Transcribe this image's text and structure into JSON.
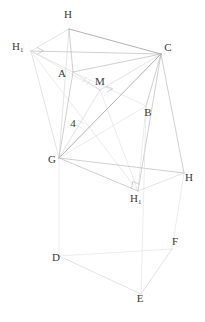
{
  "figure": {
    "canvas": {
      "width": 205,
      "height": 322
    },
    "colors": {
      "background": "#ffffff",
      "edge_dark": "#7d7d7d",
      "edge_mid": "#a8a8a8",
      "edge_light": "#c9c9c9",
      "edge_faint": "#d8d8d8",
      "label_text": "#3a3a3a"
    },
    "labels": [
      {
        "id": "label-H-top",
        "base": "H",
        "sub": "",
        "x": 68,
        "y": 18,
        "anchor": "middle"
      },
      {
        "id": "label-H1-left",
        "base": "H",
        "sub": "1",
        "x": 12,
        "y": 50,
        "anchor": "start"
      },
      {
        "id": "label-C",
        "base": "C",
        "sub": "",
        "x": 168,
        "y": 51,
        "anchor": "middle"
      },
      {
        "id": "label-A",
        "base": "A",
        "sub": "",
        "x": 62,
        "y": 77,
        "anchor": "middle"
      },
      {
        "id": "label-M",
        "base": "M",
        "sub": "",
        "x": 100,
        "y": 85,
        "anchor": "middle"
      },
      {
        "id": "label-B",
        "base": "B",
        "sub": "",
        "x": 148,
        "y": 116,
        "anchor": "middle"
      },
      {
        "id": "label-4",
        "base": "4",
        "sub": "",
        "x": 73,
        "y": 127,
        "anchor": "middle"
      },
      {
        "id": "label-G",
        "base": "G",
        "sub": "",
        "x": 52,
        "y": 163,
        "anchor": "middle"
      },
      {
        "id": "label-H-right",
        "base": "H",
        "sub": "",
        "x": 189,
        "y": 181,
        "anchor": "middle"
      },
      {
        "id": "label-H1-bottom",
        "base": "H",
        "sub": "1",
        "x": 130,
        "y": 202,
        "anchor": "start"
      },
      {
        "id": "label-F",
        "base": "F",
        "sub": "",
        "x": 175,
        "y": 245,
        "anchor": "middle"
      },
      {
        "id": "label-D",
        "base": "D",
        "sub": "",
        "x": 56,
        "y": 261,
        "anchor": "middle"
      },
      {
        "id": "label-E",
        "base": "E",
        "sub": "",
        "x": 140,
        "y": 302,
        "anchor": "middle"
      }
    ],
    "points": {
      "H_top": {
        "x": 69,
        "y": 29
      },
      "H1_left": {
        "x": 31,
        "y": 51
      },
      "C": {
        "x": 161,
        "y": 54
      },
      "A": {
        "x": 73,
        "y": 72
      },
      "M": {
        "x": 100,
        "y": 90
      },
      "B": {
        "x": 146,
        "y": 106
      },
      "G": {
        "x": 59,
        "y": 158
      },
      "H_right": {
        "x": 184,
        "y": 173
      },
      "H1_bottom": {
        "x": 138,
        "y": 191
      },
      "F": {
        "x": 172,
        "y": 249
      },
      "D": {
        "x": 59,
        "y": 256
      },
      "E": {
        "x": 141,
        "y": 294
      }
    },
    "edges": [
      {
        "name": "edge-H-top-to-H1-left",
        "from": "H_top",
        "to": "H1_left",
        "weight": "light"
      },
      {
        "name": "edge-H-top-to-C",
        "from": "H_top",
        "to": "C",
        "weight": "dark"
      },
      {
        "name": "edge-H-top-to-A",
        "from": "H_top",
        "to": "A",
        "weight": "mid"
      },
      {
        "name": "edge-H-top-to-G",
        "from": "H_top",
        "to": "G",
        "weight": "light"
      },
      {
        "name": "edge-H1-left-to-A",
        "from": "H1_left",
        "to": "A",
        "weight": "light"
      },
      {
        "name": "edge-H1-left-to-C",
        "from": "H1_left",
        "to": "C",
        "weight": "mid"
      },
      {
        "name": "edge-H1-left-to-G",
        "from": "H1_left",
        "to": "G",
        "weight": "light"
      },
      {
        "name": "edge-H1-left-to-M",
        "from": "H1_left",
        "to": "M",
        "weight": "faint"
      },
      {
        "name": "edge-H1-left-to-H1-bottom",
        "from": "H1_left",
        "to": "H1_bottom",
        "weight": "faint"
      },
      {
        "name": "edge-A-to-C",
        "from": "A",
        "to": "C",
        "weight": "mid"
      },
      {
        "name": "edge-A-to-G",
        "from": "A",
        "to": "G",
        "weight": "mid"
      },
      {
        "name": "edge-A-to-M",
        "from": "A",
        "to": "M",
        "weight": "light"
      },
      {
        "name": "edge-A-to-B",
        "from": "A",
        "to": "B",
        "weight": "faint"
      },
      {
        "name": "edge-C-to-B",
        "from": "C",
        "to": "B",
        "weight": "mid"
      },
      {
        "name": "edge-C-to-G",
        "from": "C",
        "to": "G",
        "weight": "dark"
      },
      {
        "name": "edge-C-to-M",
        "from": "C",
        "to": "M",
        "weight": "light"
      },
      {
        "name": "edge-C-to-H-right",
        "from": "C",
        "to": "H_right",
        "weight": "mid"
      },
      {
        "name": "edge-C-to-H1-bottom",
        "from": "C",
        "to": "H1_bottom",
        "weight": "mid"
      },
      {
        "name": "edge-B-to-G",
        "from": "B",
        "to": "G",
        "weight": "faint"
      },
      {
        "name": "edge-B-to-H1-bottom",
        "from": "B",
        "to": "H1_bottom",
        "weight": "faint"
      },
      {
        "name": "edge-M-to-G",
        "from": "M",
        "to": "G",
        "weight": "light"
      },
      {
        "name": "edge-M-to-H1-bottom",
        "from": "M",
        "to": "H1_bottom",
        "weight": "faint"
      },
      {
        "name": "edge-G-to-H-right",
        "from": "G",
        "to": "H_right",
        "weight": "mid"
      },
      {
        "name": "edge-G-to-H1-bottom",
        "from": "G",
        "to": "H1_bottom",
        "weight": "mid"
      },
      {
        "name": "edge-H-right-to-H1-bottom",
        "from": "H_right",
        "to": "H1_bottom",
        "weight": "light"
      },
      {
        "name": "edge-G-to-D",
        "from": "G",
        "to": "D",
        "weight": "faint"
      },
      {
        "name": "edge-H-right-to-F",
        "from": "H_right",
        "to": "F",
        "weight": "faint"
      },
      {
        "name": "edge-D-to-E",
        "from": "D",
        "to": "E",
        "weight": "light"
      },
      {
        "name": "edge-D-to-F",
        "from": "D",
        "to": "F",
        "weight": "faint"
      },
      {
        "name": "edge-E-to-F",
        "from": "E",
        "to": "F",
        "weight": "light"
      },
      {
        "name": "edge-B-to-E",
        "from": "B",
        "to": "E",
        "weight": "faint"
      }
    ],
    "right_angle_marks": [
      {
        "name": "right-angle-at-H1-left",
        "vertex": "H1_left",
        "a": "H_top",
        "b": "A",
        "size": 7
      },
      {
        "name": "right-angle-at-M",
        "vertex": "M",
        "a": "C",
        "b": "B",
        "size": 7
      },
      {
        "name": "right-angle-at-H1-bottom",
        "vertex": "H1_bottom",
        "a": "G",
        "b": "C",
        "size": 7
      }
    ],
    "tick_marks": [
      {
        "name": "tick-on-segment-M-G",
        "from": "M",
        "to": "G",
        "count": 2
      },
      {
        "name": "tick-on-segment-M-A",
        "from": "M",
        "to": "A",
        "count": 2
      }
    ],
    "measures": [
      {
        "name": "length-label-4",
        "value": "4",
        "segment": "A-G"
      }
    ]
  }
}
